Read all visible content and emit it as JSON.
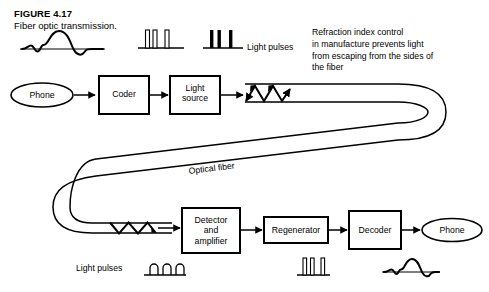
{
  "figure": {
    "number": "FIGURE 4.17",
    "caption": "Fiber optic transmission."
  },
  "annotations": {
    "light_pulses_top": "Light pulses",
    "light_pulses_bottom": "Light pulses",
    "optical_fiber": "Optical fiber",
    "refraction_note": "Refraction index control\nin manufacture prevents light\nfrom escaping from the sides of\nthe fiber"
  },
  "blocks": [
    {
      "id": "phone-in",
      "shape": "ellipse",
      "label": "Phone"
    },
    {
      "id": "coder",
      "shape": "rect",
      "label": "Coder"
    },
    {
      "id": "light-source",
      "shape": "rect",
      "label": "Light\nsource"
    },
    {
      "id": "detector-amplifier",
      "shape": "rect",
      "label": "Detector\nand\namplifier"
    },
    {
      "id": "regenerator",
      "shape": "rect",
      "label": "Regenerator"
    },
    {
      "id": "decoder",
      "shape": "rect",
      "label": "Decoder"
    },
    {
      "id": "phone-out",
      "shape": "ellipse",
      "label": "Phone"
    }
  ],
  "waveforms": {
    "analog_in": {
      "type": "analog-wave",
      "description": "input voice waveform"
    },
    "digital_outline_top": {
      "type": "pulse-train-outline",
      "bars": 3
    },
    "digital_solid_top": {
      "type": "pulse-train-solid",
      "bars": 3
    },
    "rounded_pulses_bottom": {
      "type": "pulse-train-rounded",
      "bars": 3
    },
    "digital_outline_bottom": {
      "type": "pulse-train-outline",
      "bars": 3
    },
    "analog_out": {
      "type": "analog-wave",
      "description": "output voice waveform"
    }
  },
  "colors": {
    "ink": "#000000",
    "paper": "#ffffff"
  }
}
